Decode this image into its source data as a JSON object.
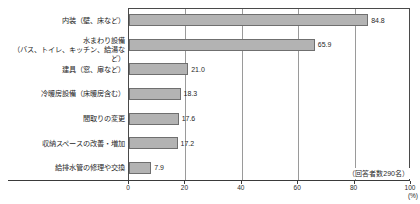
{
  "chart_data": {
    "type": "bar",
    "orientation": "horizontal",
    "title": "",
    "xlabel": "(%)",
    "ylabel": "",
    "xlim": [
      0,
      100
    ],
    "grid": true,
    "legend": false,
    "categories": [
      "内装（壁、床など）",
      "水まわり設備\n（バス、トイレ、キッチン、給湯など）",
      "建具（窓、扉など）",
      "冷暖房設備（床暖房含む）",
      "間取りの変更",
      "収納スペースの改善・増加",
      "給排水管の修理や交換"
    ],
    "values": [
      84.8,
      65.9,
      21.0,
      18.3,
      17.6,
      17.2,
      7.9
    ],
    "value_labels": [
      "84.8",
      "65.9",
      "21.0",
      "18.3",
      "17.6",
      "17.2",
      "7.9"
    ],
    "xticks": [
      0,
      20,
      40,
      60,
      80,
      100
    ],
    "xtick_labels": [
      "0",
      "20",
      "40",
      "60",
      "80",
      "100"
    ],
    "annotation": "（回答者数290名）",
    "unit": "(%)",
    "colors": {
      "bar_fill": "#b3b3b3",
      "bar_border": "#6f6f6f",
      "grid": "#9a9a9a",
      "axis": "#3a3a3a",
      "text": "#1f1f1f",
      "background": "#ffffff"
    }
  }
}
